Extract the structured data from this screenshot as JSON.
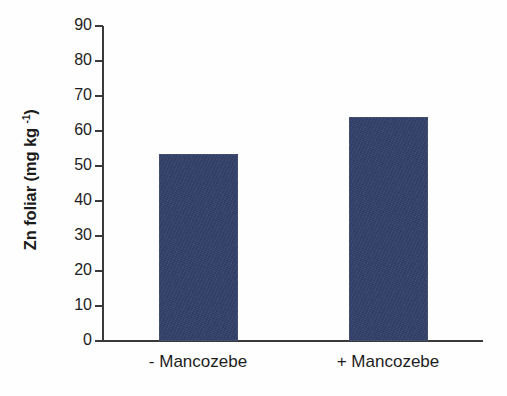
{
  "chart_data": {
    "type": "bar",
    "title": "",
    "subtitle": "",
    "xlabel": "",
    "ylabel": "Zn foliar (mg kg⁻¹)",
    "ylabel_parts": {
      "base": "Zn foliar (mg kg ",
      "sup": "-1",
      "close": ")"
    },
    "categories": [
      "- Mancozebe",
      "+ Mancozebe"
    ],
    "values": [
      53.5,
      64
    ],
    "ylim": [
      0,
      90
    ],
    "ytick_step": 10,
    "yticks": [
      "0",
      "10",
      "20",
      "30",
      "40",
      "50",
      "60",
      "70",
      "80",
      "90"
    ],
    "grid": false,
    "legend": null,
    "series": [
      {
        "name": "Zn foliar",
        "values": [
          53.5,
          64
        ],
        "color": "#33406a"
      }
    ],
    "colors": {
      "bar": "#33406a",
      "axis": "#3a3a3a",
      "text": "#1d1d1d",
      "background": "#ffffff"
    }
  }
}
